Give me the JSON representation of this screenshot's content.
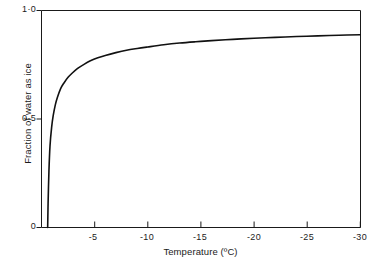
{
  "chart_data": {
    "type": "line",
    "title": "",
    "xlabel": "Temperature (ºC)",
    "ylabel": "Fraction of water as ice",
    "xlim": [
      0,
      -30
    ],
    "ylim": [
      0,
      1.0
    ],
    "grid": false,
    "legend": null,
    "x_tick_labels": [
      "-5",
      "-10",
      "-15",
      "-20",
      "-25",
      "-30"
    ],
    "x_tick_values": [
      -5,
      -10,
      -15,
      -20,
      -25,
      -30
    ],
    "y_tick_labels": [
      "1·0",
      "0·5",
      "0"
    ],
    "y_tick_values": [
      1.0,
      0.5,
      0
    ],
    "series": [
      {
        "name": "Fraction of water as ice",
        "x": [
          -0.58,
          -0.62,
          -0.7,
          -0.8,
          -0.95,
          -1.1,
          -1.3,
          -1.5,
          -1.8,
          -2.1,
          -2.5,
          -2.9,
          -3.4,
          -4.0,
          -4.6,
          -5.3,
          -6.0,
          -7.0,
          -8.0,
          -9.0,
          -10.0,
          -11.5,
          -13.0,
          -14.5,
          -16.0,
          -18.0,
          -20.0,
          -22.0,
          -24.0,
          -26.0,
          -28.0,
          -30.0
        ],
        "y": [
          0.0,
          0.11,
          0.26,
          0.375,
          0.46,
          0.515,
          0.565,
          0.6,
          0.64,
          0.665,
          0.692,
          0.712,
          0.733,
          0.752,
          0.768,
          0.782,
          0.793,
          0.806,
          0.817,
          0.825,
          0.832,
          0.842,
          0.85,
          0.856,
          0.861,
          0.867,
          0.872,
          0.876,
          0.88,
          0.883,
          0.886,
          0.888
        ]
      }
    ]
  },
  "axes": {
    "x_axis_name": "temperature-axis",
    "y_axis_name": "fraction-axis"
  }
}
